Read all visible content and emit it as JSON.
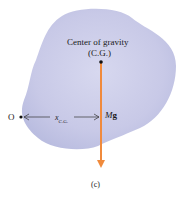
{
  "figure": {
    "caption": "(c)",
    "body_color": "#c9cbe8",
    "force_color": "#f08a3c",
    "center_of_gravity": {
      "title": "Center of gravity",
      "abbr": "(C.G.)"
    },
    "origin": {
      "label": "O"
    },
    "distance": {
      "symbol": "x",
      "subscript": "C.G."
    },
    "force": {
      "mass_symbol": "M",
      "gravity_symbol": "g"
    }
  }
}
